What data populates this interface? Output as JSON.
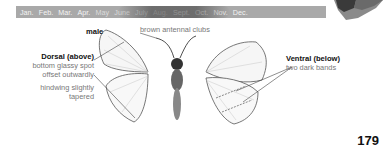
{
  "calendar": {
    "months": [
      "Jan.",
      "Feb.",
      "Mar.",
      "Apr.",
      "May",
      "June",
      "July",
      "Aug.",
      "Sept.",
      "Oct.",
      "Nov.",
      "Dec."
    ],
    "flight_period": [
      "May",
      "June",
      "July",
      "Aug."
    ]
  },
  "illustration": {
    "sex_label": "male",
    "antenna_label": "brown antennal clubs",
    "dorsal": {
      "heading": "Dorsal (above)",
      "note1_line1": "bottom glassy spot",
      "note1_line2": "offset outwardly",
      "note2_line1": "hindwing slightly",
      "note2_line2": "tapered"
    },
    "ventral": {
      "heading": "Ventral (below)",
      "note1": "two dark bands"
    }
  },
  "page_number": "179"
}
